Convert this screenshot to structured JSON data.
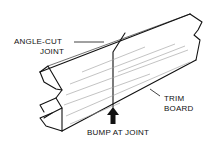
{
  "diagram": {
    "labels": {
      "angle_cut_line1": "ANGLE-CUT",
      "angle_cut_line2": "JOINT",
      "trim_line1": "TRIM",
      "trim_line2": "BOARD",
      "bump": "BUMP AT JOINT"
    },
    "colors": {
      "ink": "#111111",
      "background": "#ffffff",
      "grain": "#9a9a9a"
    }
  }
}
